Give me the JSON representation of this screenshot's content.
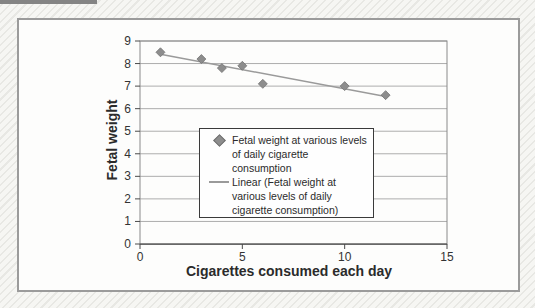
{
  "chart_data": {
    "type": "scatter",
    "title": "",
    "xlabel": "Cigarettes consumed each day",
    "ylabel": "Fetal weight",
    "xlim": [
      0,
      15
    ],
    "ylim": [
      0,
      9
    ],
    "x_ticks": [
      0,
      5,
      10,
      15
    ],
    "y_ticks": [
      0,
      1,
      2,
      3,
      4,
      5,
      6,
      7,
      8,
      9
    ],
    "grid": "horizontal gridlines on",
    "legend_position": "center of plot area",
    "series": [
      {
        "name": "Fetal weight at various levels of daily cigarette consumption",
        "type": "scatter",
        "marker": "diamond",
        "points": [
          [
            1,
            8.5
          ],
          [
            3,
            8.2
          ],
          [
            4,
            7.8
          ],
          [
            5,
            7.9
          ],
          [
            6,
            7.1
          ],
          [
            10,
            7.0
          ],
          [
            12,
            6.6
          ]
        ]
      },
      {
        "name": "Linear (Fetal weight at various levels of daily cigarette consumption)",
        "type": "linear-trendline",
        "trendline": {
          "slope": -0.17,
          "intercept": 8.58,
          "x_start": 1,
          "x_end": 12
        }
      }
    ],
    "legend": {
      "entries": [
        {
          "marker": "diamond",
          "lines": [
            "Fetal weight at various levels",
            "of daily cigarette",
            "consumption"
          ]
        },
        {
          "marker": "line",
          "lines": [
            "Linear (Fetal weight at",
            "various levels of daily",
            "cigarette consumption)"
          ]
        }
      ]
    }
  },
  "colors": {
    "marker_fill": "#8d8d8d",
    "marker_stroke": "#707070",
    "trend_line": "#9a9a9a",
    "gridline": "#adadad",
    "frame": "#8a8a8a",
    "axis": "#4a4a4a",
    "tick_text": "#333333",
    "panel_border": "#9b9b9b",
    "page_background": "#f5f5f2"
  }
}
